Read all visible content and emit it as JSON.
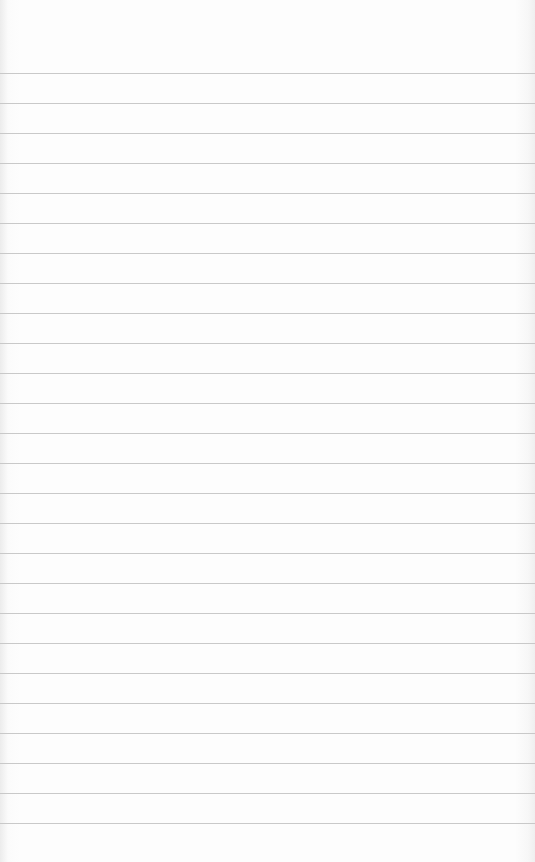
{
  "paper": {
    "type": "ruled-notebook-paper",
    "line_color": "#c9c9c9",
    "background_color": "#fdfdfd",
    "first_line_y": 73,
    "line_spacing": 30,
    "line_count": 26
  }
}
